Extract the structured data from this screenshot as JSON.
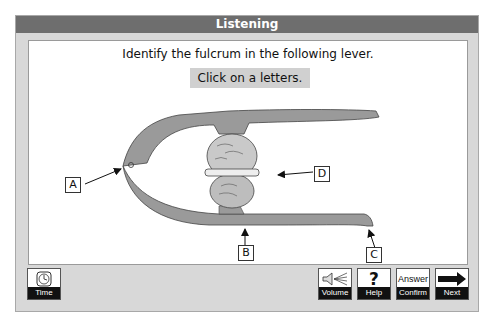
{
  "window": {
    "title": "Listening"
  },
  "question": {
    "prompt": "Identify the fulcrum in the following lever.",
    "instruction": "Click on a letters."
  },
  "diagram": {
    "labels": [
      {
        "id": "A",
        "text": "A",
        "points_to": "hinge-pivot"
      },
      {
        "id": "B",
        "text": "B",
        "points_to": "lower-arm-under-nut"
      },
      {
        "id": "C",
        "text": "C",
        "points_to": "lower-handle-end"
      },
      {
        "id": "D",
        "text": "D",
        "points_to": "walnut"
      }
    ]
  },
  "toolbar": {
    "time": {
      "label": "Time",
      "icon": "clock-icon"
    },
    "volume": {
      "label": "Volume",
      "icon": "speaker-icon"
    },
    "help": {
      "label": "Help",
      "icon": "question-mark-icon",
      "glyph": "?"
    },
    "confirm": {
      "label": "Confirm",
      "icon_text": "Answer"
    },
    "next": {
      "label": "Next",
      "icon": "arrow-right-icon"
    }
  }
}
